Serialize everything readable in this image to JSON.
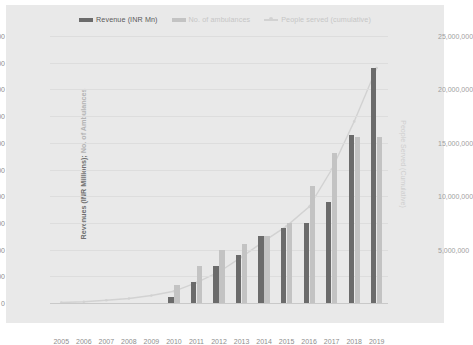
{
  "legend": [
    {
      "name": "revenue",
      "label": "Revenue (INR Mn)",
      "type": "bar",
      "color": "#6b6b6b"
    },
    {
      "name": "ambulances",
      "label": "No. of ambulances",
      "type": "bar",
      "color": "#c3c3c3"
    },
    {
      "name": "people-served",
      "label": "People served (cumulative)",
      "type": "line",
      "color": "#d2d2d2"
    }
  ],
  "axes": {
    "left_title_main": "Revenues (INR Millions); ",
    "left_title_soft": "No. of Ambulances",
    "right_title": "People Served (Cumulative)",
    "left_ticks": [
      "0",
      "500",
      "1,000",
      "1,500",
      "2,000",
      "2,500",
      "3,000",
      "3,500",
      "4,000",
      "4,500",
      "5,000"
    ],
    "right_ticks": [
      "0",
      "5,000,000",
      "10,000,000",
      "15,000,000",
      "20,000,000",
      "25,000,000"
    ],
    "x_ticks": [
      "2005",
      "2006",
      "2007",
      "2008",
      "2009",
      "2010",
      "2011",
      "2012",
      "2013",
      "2014",
      "2015",
      "2016",
      "2017",
      "2018",
      "2019"
    ]
  },
  "chart_data": {
    "type": "bar",
    "title": "",
    "xlabel": "",
    "ylabel": "Revenues (INR Millions); No. of Ambulances",
    "y2label": "People Served (Cumulative)",
    "categories": [
      "2005",
      "2006",
      "2007",
      "2008",
      "2009",
      "2010",
      "2011",
      "2012",
      "2013",
      "2014",
      "2015",
      "2016",
      "2017",
      "2018",
      "2019"
    ],
    "ylim": [
      0,
      5000
    ],
    "y2lim": [
      0,
      25000000
    ],
    "ytick_step": 500,
    "y2tick_step": 5000000,
    "grid": true,
    "legend_position": "top-center",
    "series": [
      {
        "name": "Revenue (INR Mn)",
        "type": "bar",
        "axis": "left",
        "color": "#6b6b6b",
        "values": [
          0,
          0,
          0,
          0,
          0,
          120,
          400,
          700,
          900,
          1250,
          1400,
          1500,
          1900,
          3150,
          4400
        ]
      },
      {
        "name": "No. of ambulances",
        "type": "bar",
        "axis": "left",
        "color": "#c3c3c3",
        "values": [
          0,
          0,
          0,
          0,
          0,
          330,
          700,
          1000,
          1100,
          1250,
          1500,
          2200,
          2800,
          3100,
          3100
        ]
      },
      {
        "name": "People served (cumulative)",
        "type": "line",
        "axis": "right",
        "color": "#d2d2d2",
        "values": [
          50000,
          120000,
          250000,
          420000,
          700000,
          1100000,
          1900000,
          2900000,
          4300000,
          5800000,
          7200000,
          9000000,
          12500000,
          17000000,
          22000000
        ]
      }
    ]
  }
}
